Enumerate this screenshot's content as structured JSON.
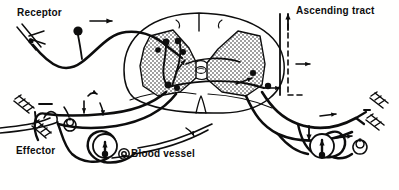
{
  "figure": {
    "background_color": "#fffffe",
    "ink_color": "#0d0d0d",
    "width": 399,
    "height": 190
  },
  "labels": {
    "receptor": "Receptor",
    "ascending_tract": "Ascending tract",
    "effector": "Effector",
    "blood_vessel": "Blood vessel"
  },
  "structures": {
    "spinal_cord": "spinal-cord-cross-section",
    "gray_matter": "butterfly-gray-matter-stippled",
    "dorsal_sulcus": "dorsal-median-sulcus",
    "ventral_fissure": "ventral-median-fissure",
    "dorsal_root": "dorsal-root-afferent",
    "ventral_root": "ventral-root-efferent",
    "synaptic_boutons": "synaptic-bouton",
    "ganglion": "ganglion-cell-body",
    "spiral_ending": "spiral-nerve-ending",
    "muscle_ending": "striated-muscle-ending",
    "receptor_ending": "free-nerve-ending",
    "ascending_dashed": "ascending-tract-dashed-path",
    "flow_arrow": "flow-direction-arrow"
  }
}
